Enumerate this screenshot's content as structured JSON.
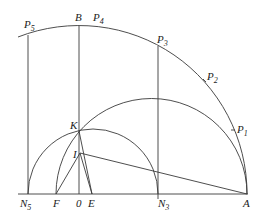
{
  "figure": {
    "type": "geometric-construction",
    "points": {
      "P5": {
        "label": "P",
        "sub": "5"
      },
      "B": {
        "label": "B",
        "sub": ""
      },
      "P4": {
        "label": "P",
        "sub": "4"
      },
      "P3": {
        "label": "P",
        "sub": "3"
      },
      "P2": {
        "label": "P",
        "sub": "2"
      },
      "P1": {
        "label": "P",
        "sub": "1"
      },
      "K": {
        "label": "K",
        "sub": ""
      },
      "I": {
        "label": "I",
        "sub": ""
      },
      "N5": {
        "label": "N",
        "sub": "5"
      },
      "F": {
        "label": "F",
        "sub": ""
      },
      "O": {
        "label": "0",
        "sub": ""
      },
      "E": {
        "label": "E",
        "sub": ""
      },
      "N3": {
        "label": "N",
        "sub": "3"
      },
      "A": {
        "label": "A",
        "sub": ""
      }
    },
    "segments": [
      [
        "N5",
        "A"
      ],
      [
        "N5",
        "P5"
      ],
      [
        "O",
        "B"
      ],
      [
        "N3",
        "P3"
      ],
      [
        "I",
        "A"
      ],
      [
        "K",
        "E"
      ],
      [
        "I",
        "F"
      ],
      [
        "I",
        "E"
      ]
    ],
    "arcs": [
      {
        "name": "large-arc",
        "center": "O",
        "through": [
          "P5",
          "B",
          "P4",
          "P3",
          "P2",
          "P1",
          "A"
        ]
      },
      {
        "name": "semicircle-FA",
        "diameter": [
          "F",
          "A"
        ],
        "through": [
          "K"
        ]
      },
      {
        "name": "semicircle-N5N3",
        "diameter": [
          "N5",
          "N3"
        ],
        "through": [
          "K"
        ]
      }
    ]
  }
}
